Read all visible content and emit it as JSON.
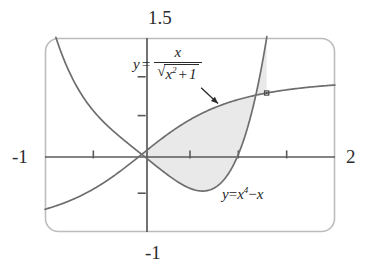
{
  "figure": {
    "title": "",
    "kind": "graphing-calculator-viewport"
  },
  "viewport": {
    "xmin_label": "-1",
    "xmax_label": "2",
    "ymin_label": "-1",
    "ymax_label": "1.5"
  },
  "annotations": {
    "sigmoid": {
      "lhs": "y",
      "equals": "=",
      "numerator": "x",
      "radical_sign": "√",
      "denominator_base": "x",
      "denominator_exponent": "2",
      "denominator_plus": "+",
      "denominator_tail": "1"
    },
    "quartic": {
      "lhs": "y",
      "equals": "=",
      "base": "x",
      "exponent": "4",
      "minus": "−",
      "tail": "x"
    },
    "pointer_icon": "arrow-icon",
    "intersection_marker_icon": "square-marker-icon"
  },
  "colors": {
    "frame": "#b9b9b9",
    "axis": "#5a5a5a",
    "curve": "#6e6e6e",
    "shade": "#e9e9e9",
    "text": "#2b2b2b",
    "marker": "#4a4a4a"
  },
  "chart_data": {
    "type": "line",
    "title": "",
    "xlabel": "",
    "ylabel": "",
    "xlim": [
      -1,
      2
    ],
    "ylim": [
      -1,
      1.5
    ],
    "grid": false,
    "legend": "inline-annotations",
    "xticks": [
      -1,
      -0.5,
      0,
      0.5,
      1,
      1.5,
      2
    ],
    "yticks": [
      -1,
      -0.5,
      0,
      0.5,
      1,
      1.5
    ],
    "xtick_labels": [
      "-1",
      "",
      "",
      "",
      "",
      "",
      "2"
    ],
    "ytick_labels": [
      "-1",
      "",
      "",
      "",
      "",
      "1.5"
    ],
    "series": [
      {
        "name": "y = x/sqrt(x^2+1)",
        "expression": "x/Math.sqrt(x*x+1)",
        "color": "#6e6e6e",
        "x": [
          -1,
          -0.9,
          -0.8,
          -0.7,
          -0.6,
          -0.5,
          -0.4,
          -0.3,
          -0.2,
          -0.1,
          0,
          0.1,
          0.2,
          0.3,
          0.4,
          0.5,
          0.6,
          0.7,
          0.8,
          0.9,
          1,
          1.1,
          1.2,
          1.3,
          1.4,
          1.5,
          1.6,
          1.7,
          1.8,
          1.9,
          2
        ],
        "values": [
          -0.707,
          -0.669,
          -0.625,
          -0.573,
          -0.514,
          -0.447,
          -0.371,
          -0.287,
          -0.196,
          -0.0995,
          0,
          0.0995,
          0.196,
          0.287,
          0.371,
          0.447,
          0.514,
          0.573,
          0.625,
          0.669,
          0.707,
          0.74,
          0.768,
          0.793,
          0.814,
          0.832,
          0.848,
          0.862,
          0.874,
          0.885,
          0.894
        ]
      },
      {
        "name": "y = x^4 - x",
        "expression": "Math.pow(x,4)-x",
        "color": "#6e6e6e",
        "x": [
          -1,
          -0.9,
          -0.8,
          -0.7,
          -0.6,
          -0.5,
          -0.4,
          -0.3,
          -0.2,
          -0.1,
          0,
          0.1,
          0.2,
          0.3,
          0.4,
          0.5,
          0.6,
          0.7,
          0.8,
          0.9,
          1,
          1.1,
          1.2,
          1.3,
          1.4,
          1.5
        ],
        "values": [
          2,
          1.556,
          1.21,
          0.94,
          0.73,
          0.563,
          0.426,
          0.308,
          0.202,
          0.1001,
          0,
          -0.0999,
          -0.1984,
          -0.2919,
          -0.3744,
          -0.4375,
          -0.4704,
          -0.4599,
          -0.3904,
          -0.2439,
          0,
          0.3641,
          0.8736,
          1.5561,
          2.4416,
          3.5625
        ]
      }
    ],
    "shaded_region": {
      "label": "area between curves",
      "between": [
        "y = x/sqrt(x^2+1)",
        "y = x^4 - x"
      ],
      "x_from": 0,
      "x_to": 1.2928,
      "fill": "#e9e9e9"
    },
    "markers": [
      {
        "name": "intersection-point",
        "x": 1.2928,
        "y": 0.7911,
        "style": "small-open-square"
      }
    ],
    "arrow_annotation": {
      "label_target": "y = x/sqrt(x^2+1)",
      "from": [
        0.615,
        0.86
      ],
      "to": [
        0.79,
        0.655
      ]
    }
  }
}
